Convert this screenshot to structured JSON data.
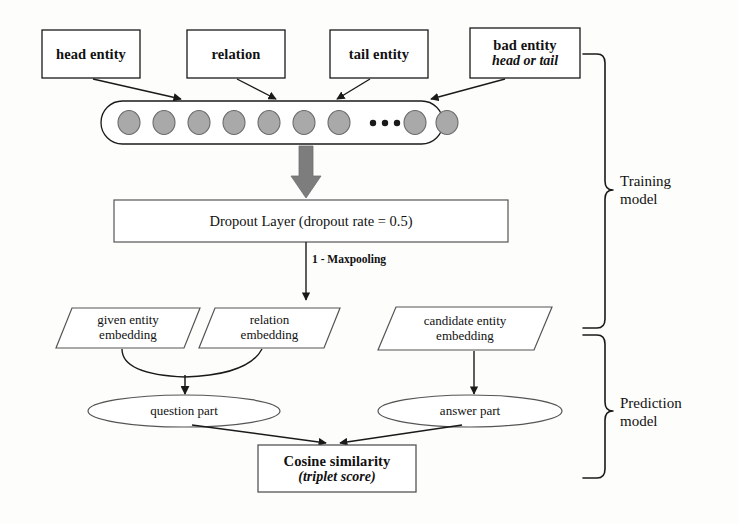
{
  "diagram": {
    "colors": {
      "stroke": "#1a1a1a",
      "fill": "#ffffff",
      "circle_fill": "#a9a9a9",
      "circle_stroke": "#6b6b6b",
      "big_arrow": "#7d7d7d",
      "background": "#fdfdfb",
      "text": "#111111"
    }
  },
  "input_boxes": [
    {
      "id": "head-entity",
      "label": "head entity",
      "sub": ""
    },
    {
      "id": "relation",
      "label": "relation",
      "sub": ""
    },
    {
      "id": "tail-entity",
      "label": "tail entity",
      "sub": ""
    },
    {
      "id": "bad-entity",
      "label": "bad entity",
      "sub": "head or tail"
    }
  ],
  "embedding_vector": {
    "name": "embedding-vector",
    "circles_left": 7,
    "circles_right": 2,
    "ellipsis": "• • •"
  },
  "dropout": {
    "label": "Dropout Layer (dropout rate = 0.5)"
  },
  "edges": {
    "maxpooling_label": "1 - Maxpooling"
  },
  "embeddings": [
    {
      "id": "given-entity-embedding",
      "line1": "given entity",
      "line2": "embedding"
    },
    {
      "id": "relation-embedding",
      "line1": "relation",
      "line2": "embedding"
    },
    {
      "id": "candidate-entity-embedding",
      "line1": "candidate entity",
      "line2": "embedding"
    }
  ],
  "parts": [
    {
      "id": "question-part",
      "label": "question part"
    },
    {
      "id": "answer-part",
      "label": "answer part"
    }
  ],
  "output": {
    "line1": "Cosine similarity",
    "line2": "(triplet score)"
  },
  "braces": [
    {
      "id": "training-model",
      "line1": "Training",
      "line2": "model"
    },
    {
      "id": "prediction-model",
      "line1": "Prediction",
      "line2": "model"
    }
  ]
}
